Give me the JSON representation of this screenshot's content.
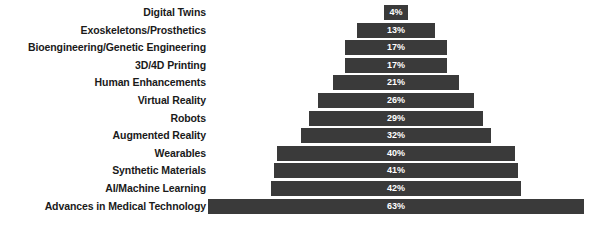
{
  "chart_data": {
    "type": "bar",
    "orientation": "horizontal",
    "style": "centered-pyramid",
    "title": "",
    "subtitle": "",
    "xlabel": "",
    "ylabel": "",
    "grid": false,
    "legend": null,
    "axis_visible": false,
    "value_suffix": "%",
    "xlim": [
      0,
      63
    ],
    "categories": [
      "Digital Twins",
      "Exoskeletons/Prosthetics",
      "Bioengineering/Genetic Engineering",
      "3D/4D Printing",
      "Human Enhancements",
      "Virtual Reality",
      "Robots",
      "Augmented Reality",
      "Wearables",
      "Synthetic Materials",
      "AI/Machine Learning",
      "Advances in Medical Technology"
    ],
    "values": [
      4,
      13,
      17,
      17,
      21,
      26,
      29,
      32,
      40,
      41,
      42,
      63
    ],
    "data_labels": [
      "4%",
      "13%",
      "17%",
      "17%",
      "21%",
      "26%",
      "29%",
      "32%",
      "40%",
      "41%",
      "42%",
      "63%"
    ],
    "colors": {
      "bar": "#3a3a3a",
      "data_label_text": "#ffffff",
      "category_label_text": "#1a1a1a",
      "background": "#ffffff"
    }
  }
}
